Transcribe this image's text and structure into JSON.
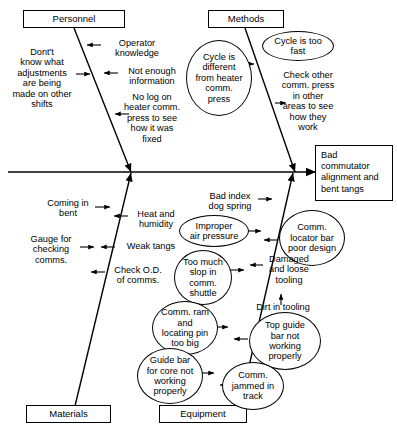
{
  "diagram": {
    "type": "fishbone-ishikawa",
    "effect": {
      "label": "Bad commutator alignment and bent tangs"
    },
    "categories": [
      {
        "id": "personnel",
        "label": "Personnel",
        "position": "top-left"
      },
      {
        "id": "methods",
        "label": "Methods",
        "position": "top-right"
      },
      {
        "id": "materials",
        "label": "Materials",
        "position": "bottom-left"
      },
      {
        "id": "equipment",
        "label": "Equipment",
        "position": "bottom-right"
      }
    ],
    "causes": {
      "personnel": [
        {
          "id": "operator-knowledge",
          "text": "Operator\nknowledge",
          "shape": "text"
        },
        {
          "id": "dont-know-adjustments",
          "text": "Dont't\nknow what\nadjustments\nare being\nmade on other\nshifts",
          "shape": "text"
        },
        {
          "id": "not-enough-information",
          "text": "Not enough\ninformation",
          "shape": "text"
        },
        {
          "id": "no-log-heater-comm-press",
          "text": "No log on\nheater comm.\npress to see\nhow it was\nfixed",
          "shape": "text"
        }
      ],
      "methods": [
        {
          "id": "cycle-too-fast",
          "text": "Cycle is too\nfast",
          "shape": "ellipse"
        },
        {
          "id": "cycle-different-heater",
          "text": "Cycle is\ndifferent\nfrom heater\ncomm.\npress",
          "shape": "ellipse"
        },
        {
          "id": "check-other-comm-press",
          "text": "Check other\ncomm. press\nin other\nareas to see\nhow they\nwork",
          "shape": "text"
        }
      ],
      "materials": [
        {
          "id": "coming-in-bent",
          "text": "Coming in\nbent",
          "shape": "text"
        },
        {
          "id": "heat-and-humidity",
          "text": "Heat and\nhumidity",
          "shape": "text"
        },
        {
          "id": "gauge-for-checking-comms",
          "text": "Gauge for\nchecking\ncomms.",
          "shape": "text"
        },
        {
          "id": "weak-tangs",
          "text": "Weak tangs",
          "shape": "text"
        },
        {
          "id": "check-od-of-comms",
          "text": "Check O.D.\nof comms.",
          "shape": "text"
        }
      ],
      "equipment": [
        {
          "id": "bad-index-dog-spring",
          "text": "Bad index\ndog spring",
          "shape": "text"
        },
        {
          "id": "improper-air-pressure",
          "text": "Improper\nair pressure",
          "shape": "ellipse"
        },
        {
          "id": "comm-locator-bar-poor-design",
          "text": "Comm.\nlocator bar\npoor design",
          "shape": "ellipse"
        },
        {
          "id": "too-much-slop-comm-shuttle",
          "text": "Too much\nslop in\ncomm.\nshuttle",
          "shape": "ellipse"
        },
        {
          "id": "damaged-and-loose-tooling",
          "text": "Damaged\nand loose\ntooling",
          "shape": "text"
        },
        {
          "id": "dirt-in-tooling",
          "text": "Dirt in tooling",
          "shape": "text"
        },
        {
          "id": "comm-ram-locating-pin-too-big",
          "text": "Comm. ram\nand\nlocating pin\ntoo big",
          "shape": "ellipse"
        },
        {
          "id": "top-guide-bar-not-working",
          "text": "Top guide\nbar not\nworking\nproperly",
          "shape": "ellipse"
        },
        {
          "id": "guide-bar-for-core-not-working",
          "text": "Guide bar\nfor core not\nworking\nproperly",
          "shape": "ellipse"
        },
        {
          "id": "comm-jammed-in-track",
          "text": "Comm.\njammed in\ntrack",
          "shape": "ellipse"
        }
      ]
    },
    "colors": {
      "line": "#000000",
      "background": "#ffffff",
      "text": "#000000"
    }
  }
}
